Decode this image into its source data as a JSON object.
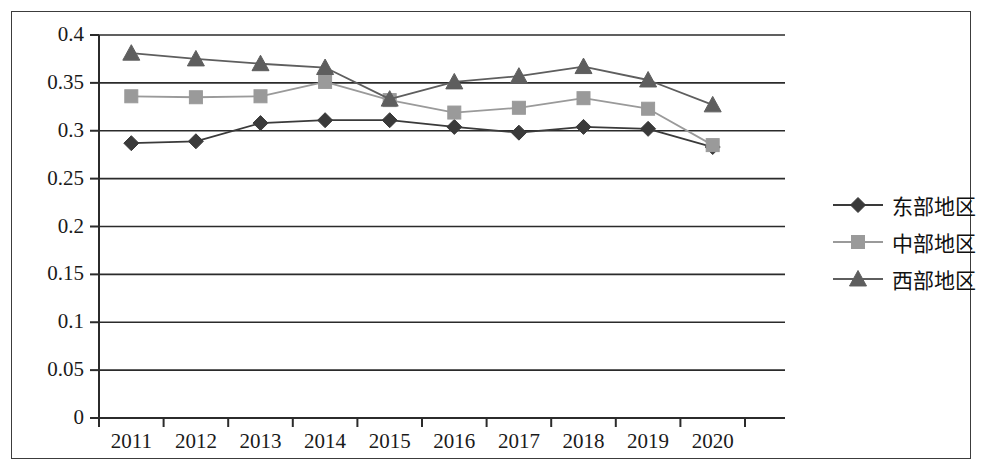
{
  "chart_data": {
    "type": "line",
    "title": "",
    "xlabel": "",
    "ylabel": "",
    "categories": [
      "2011",
      "2012",
      "2013",
      "2014",
      "2015",
      "2016",
      "2017",
      "2018",
      "2019",
      "2020"
    ],
    "series": [
      {
        "name": "东部地区",
        "marker": "diamond",
        "color": "#3a3a3a",
        "values": [
          0.287,
          0.289,
          0.308,
          0.311,
          0.311,
          0.304,
          0.298,
          0.304,
          0.302,
          0.283
        ]
      },
      {
        "name": "中部地区",
        "marker": "square",
        "color": "#9a9a9a",
        "values": [
          0.336,
          0.335,
          0.336,
          0.351,
          0.332,
          0.319,
          0.324,
          0.334,
          0.323,
          0.285
        ]
      },
      {
        "name": "西部地区",
        "marker": "triangle",
        "color": "#5e5e5e",
        "values": [
          0.381,
          0.375,
          0.37,
          0.366,
          0.333,
          0.351,
          0.357,
          0.367,
          0.353,
          0.327
        ]
      }
    ],
    "ylim": [
      0,
      0.4
    ],
    "yticks": [
      "0",
      "0.05",
      "0.1",
      "0.15",
      "0.2",
      "0.25",
      "0.3",
      "0.35",
      "0.4"
    ],
    "ytick_values": [
      0,
      0.05,
      0.1,
      0.15,
      0.2,
      0.25,
      0.3,
      0.35,
      0.4
    ],
    "grid": true,
    "grid_axis": "y",
    "legend_position": "right"
  },
  "axes": {
    "y_labels": [
      "0.4",
      "0.35",
      "0.3",
      "0.25",
      "0.2",
      "0.15",
      "0.1",
      "0.05",
      "0"
    ],
    "x_labels": [
      "2011",
      "2012",
      "2013",
      "2014",
      "2015",
      "2016",
      "2017",
      "2018",
      "2019",
      "2020"
    ]
  },
  "legend": {
    "items": [
      {
        "label": "东部地区"
      },
      {
        "label": "中部地区"
      },
      {
        "label": "西部地区"
      }
    ]
  },
  "colors": {
    "east": "#3a3a3a",
    "central": "#9a9a9a",
    "west": "#5e5e5e",
    "axis": "#2b2b2b",
    "frame": "#3c3c3c",
    "grid": "#2b2b2b"
  }
}
